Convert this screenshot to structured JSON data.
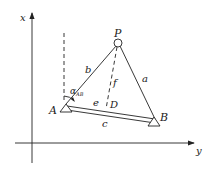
{
  "diagram": {
    "axes": {
      "vertical_label": "x",
      "horizontal_label": "y"
    },
    "points": {
      "P": "P",
      "A": "A",
      "B": "B",
      "D": "D"
    },
    "segments": {
      "a": "a",
      "b": "b",
      "c": "c",
      "e": "e",
      "f": "f"
    },
    "angle": {
      "symbol": "α",
      "subscript": "AB"
    },
    "colors": {
      "stroke": "#222222",
      "background": "#ffffff"
    }
  }
}
